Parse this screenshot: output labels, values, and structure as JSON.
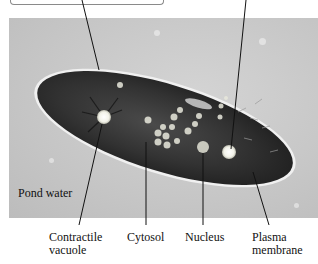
{
  "figure": {
    "background_label": "Pond water",
    "labels": [
      {
        "id": "contractile-vacuole",
        "line1": "Contractile",
        "line2": "vacuole"
      },
      {
        "id": "cytosol",
        "line1": "Cytosol",
        "line2": ""
      },
      {
        "id": "nucleus",
        "line1": "Nucleus",
        "line2": ""
      },
      {
        "id": "plasma-membrane",
        "line1": "Plasma",
        "line2": "membrane"
      }
    ],
    "colors": {
      "panel_bg": "#c8c8c8",
      "cell_interior": "#2e2e2e",
      "membrane": "#eeeeee",
      "leader_line": "#111111"
    }
  }
}
